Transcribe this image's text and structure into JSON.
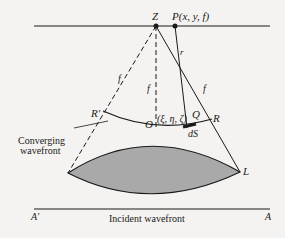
{
  "diagram": {
    "points": {
      "Z": "Z",
      "P": "P(x, y, f)",
      "R_prime": "R′",
      "R": "R",
      "O": "O",
      "Q": "Q",
      "L": "L",
      "A_prime": "A′",
      "A": "A",
      "xi": "(ξ, η, ζ)"
    },
    "labels": {
      "f_left": "f",
      "f_center": "f",
      "f_right": "f",
      "r": "r",
      "dS": "dS",
      "converging_line1": "Converging",
      "converging_line2": "wavefront",
      "incident": "Incident wavefront"
    },
    "colors": {
      "ink": "#1a1a1a",
      "lens_fill": "#a9a9a9",
      "background": "#f4f3f1"
    }
  }
}
